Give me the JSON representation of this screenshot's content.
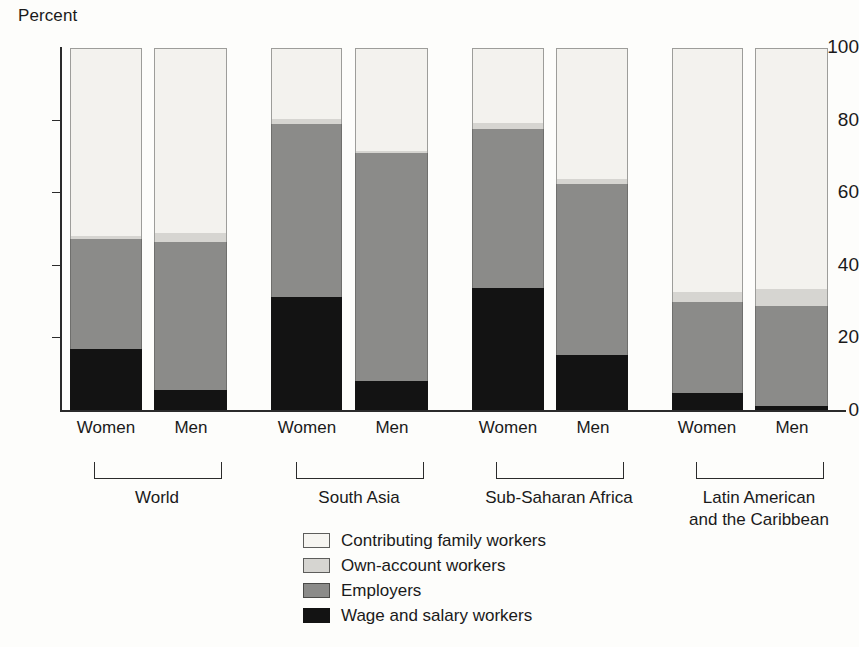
{
  "chart_data": {
    "type": "bar",
    "subtype": "stacked-bar-100",
    "title": "",
    "ylabel": "Percent",
    "xlabel": "",
    "ylim": [
      0,
      100
    ],
    "yticks": [
      0,
      20,
      40,
      60,
      80,
      100
    ],
    "grid": false,
    "legend_position": "bottom-center",
    "series": [
      {
        "name": "Wage and salary workers",
        "color": "#131313",
        "values": [
          16.8,
          5.5,
          31.3,
          8.0,
          33.8,
          15.2,
          4.7,
          1.0
        ]
      },
      {
        "name": "Employers",
        "color": "#8b8b89",
        "values": [
          30.4,
          40.9,
          47.7,
          63.0,
          43.7,
          47.3,
          25.1,
          27.8
        ]
      },
      {
        "name": "Own-account workers",
        "color": "#d6d5d1",
        "values": [
          1.0,
          2.6,
          1.5,
          0.6,
          1.9,
          1.4,
          2.7,
          4.6
        ]
      },
      {
        "name": "Contributing family workers",
        "color": "#f3f2ee",
        "values": [
          51.8,
          51.0,
          19.5,
          28.4,
          20.6,
          36.1,
          67.5,
          66.6
        ]
      }
    ],
    "bars": [
      {
        "group": "World",
        "sex": "Women",
        "wage_and_salary_workers": 16.8,
        "employers_top": 47.2,
        "own_account_top": 48.2,
        "total": 100
      },
      {
        "group": "World",
        "sex": "Men",
        "wage_and_salary_workers": 5.5,
        "employers_top": 46.4,
        "own_account_top": 49.0,
        "total": 100
      },
      {
        "group": "South Asia",
        "sex": "Women",
        "wage_and_salary_workers": 31.3,
        "employers_top": 79.0,
        "own_account_top": 80.5,
        "total": 100
      },
      {
        "group": "South Asia",
        "sex": "Men",
        "wage_and_salary_workers": 8.0,
        "employers_top": 71.0,
        "own_account_top": 71.6,
        "total": 100
      },
      {
        "group": "Sub-Saharan Africa",
        "sex": "Women",
        "wage_and_salary_workers": 33.8,
        "employers_top": 77.5,
        "own_account_top": 79.4,
        "total": 100
      },
      {
        "group": "Sub-Saharan Africa",
        "sex": "Men",
        "wage_and_salary_workers": 15.2,
        "employers_top": 62.5,
        "own_account_top": 63.9,
        "total": 100
      },
      {
        "group": "Latin American and the Caribbean",
        "sex": "Women",
        "wage_and_salary_workers": 4.7,
        "employers_top": 29.8,
        "own_account_top": 32.5,
        "total": 100
      },
      {
        "group": "Latin American and the Caribbean",
        "sex": "Men",
        "wage_and_salary_workers": 1.0,
        "employers_top": 28.8,
        "own_account_top": 33.4,
        "total": 100
      }
    ],
    "categories": [
      "World – Women",
      "World – Men",
      "South Asia – Women",
      "South Asia – Men",
      "Sub-Saharan Africa – Women",
      "Sub-Saharan Africa – Men",
      "Latin American and the Caribbean – Women",
      "Latin American and the Caribbean – Men"
    ]
  },
  "axis": {
    "y_title": "Percent",
    "y_ticks": [
      "100",
      "80",
      "60",
      "40",
      "20",
      "0"
    ]
  },
  "bar_labels": [
    {
      "sex": "Women"
    },
    {
      "sex": "Men"
    },
    {
      "sex": "Women"
    },
    {
      "sex": "Men"
    },
    {
      "sex": "Women"
    },
    {
      "sex": "Men"
    },
    {
      "sex": "Women"
    },
    {
      "sex": "Men"
    }
  ],
  "groups": [
    {
      "label": "World"
    },
    {
      "label": "South Asia"
    },
    {
      "label": "Sub-Saharan Africa"
    },
    {
      "label": "Latin American\nand the Caribbean"
    }
  ],
  "legend": {
    "items": [
      {
        "label": "Contributing family workers",
        "color": "#f3f2ee"
      },
      {
        "label": "Own-account workers",
        "color": "#d6d5d1"
      },
      {
        "label": "Employers",
        "color": "#8b8b89"
      },
      {
        "label": "Wage and salary workers",
        "color": "#131313"
      }
    ]
  }
}
